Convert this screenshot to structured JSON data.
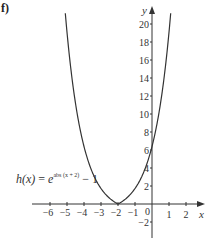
{
  "part_label": "f)",
  "function_label": {
    "name": "h(x)",
    "equals": "=",
    "base": "e",
    "exponent": "abs (x + 2)",
    "tail": "− 1"
  },
  "axes": {
    "x_label": "x",
    "y_label": "y",
    "x_ticks": [
      "−6",
      "−5",
      "−4",
      "−3",
      "−2",
      "−1",
      "1",
      "2"
    ],
    "y_ticks": [
      "20",
      "18",
      "16",
      "14",
      "12",
      "10",
      "8",
      "6",
      "4",
      "2",
      "−2"
    ],
    "origin_label": "0"
  },
  "chart_data": {
    "type": "line",
    "title": "",
    "function": "h(x) = e^{abs(x+2)} - 1",
    "xlabel": "x",
    "ylabel": "y",
    "xlim": [
      -7,
      3
    ],
    "ylim": [
      -3,
      22
    ],
    "x_ticks": [
      -6,
      -5,
      -4,
      -3,
      -2,
      -1,
      1,
      2
    ],
    "y_ticks": [
      -2,
      2,
      4,
      6,
      8,
      10,
      12,
      14,
      16,
      18,
      20
    ],
    "grid": false,
    "series": [
      {
        "name": "h(x) = e^{abs(x+2)} - 1",
        "x": [
          -5.1,
          -5,
          -4.5,
          -4,
          -3.5,
          -3,
          -2.5,
          -2,
          -1.5,
          -1,
          -0.5,
          0,
          0.5,
          1,
          1.1
        ],
        "y": [
          21.2,
          19.09,
          11.18,
          6.39,
          3.48,
          1.72,
          0.65,
          0,
          0.65,
          1.72,
          3.48,
          6.39,
          11.18,
          19.09,
          21.2
        ]
      }
    ],
    "annotations": [
      "minimum at (-2, 0)",
      "y-intercept at (0, e^2 - 1 ≈ 6.39)"
    ]
  }
}
